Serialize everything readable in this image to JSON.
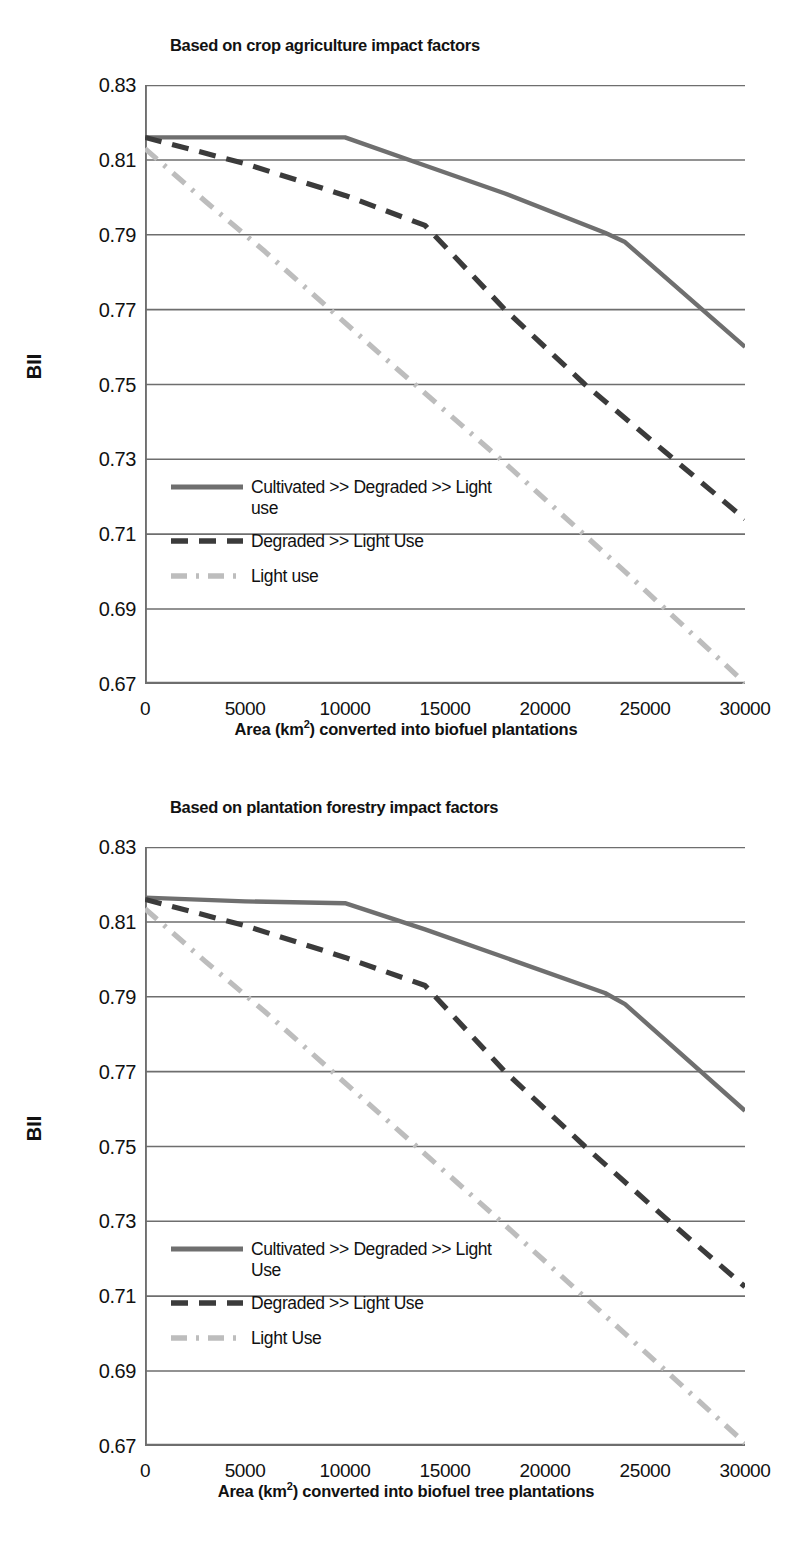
{
  "figure": {
    "panels": [
      {
        "id": "top",
        "title": "Based on crop agriculture impact factors",
        "ylabel": "BII",
        "xlabel_html": "Area (km<sup>2</sup>) converted into biofuel plantations",
        "xlabel": "Area (km2) converted into biofuel plantations",
        "legend": [
          "Cultivated >> Degraded >> Light use",
          "Degraded >> Light Use",
          "Light use"
        ]
      },
      {
        "id": "bottom",
        "title": "Based on plantation forestry impact factors",
        "ylabel": "BII",
        "xlabel_html": "Area (km<sup>2</sup>) converted into biofuel tree plantations",
        "xlabel": "Area (km2) converted into biofuel tree plantations",
        "legend": [
          "Cultivated >> Degraded >> Light Use",
          "Degraded >> Light Use",
          "Light Use"
        ]
      }
    ],
    "colors": {
      "solid": "#6f6f6f",
      "dashed": "#3b3b3b",
      "dashdot": "#bdbdbd",
      "grid": "#6e6e6e",
      "axis": "#6e6e6e",
      "text": "#111111"
    }
  },
  "chart_data": [
    {
      "type": "line",
      "id": "top",
      "title": "Based on crop agriculture impact factors",
      "xlabel": "Area (km2) converted into biofuel plantations",
      "ylabel": "BII",
      "xlim": [
        0,
        30000
      ],
      "ylim": [
        0.67,
        0.83
      ],
      "xticks": [
        0,
        5000,
        10000,
        15000,
        20000,
        25000,
        30000
      ],
      "yticks": [
        0.67,
        0.69,
        0.71,
        0.73,
        0.75,
        0.77,
        0.79,
        0.81,
        0.83
      ],
      "grid": "horizontal",
      "legend_position": "inside-lower-left",
      "series": [
        {
          "name": "Cultivated >> Degraded >> Light use",
          "style": "solid",
          "color": "#6f6f6f",
          "x": [
            0,
            5000,
            10000,
            14000,
            18000,
            23000,
            24000,
            30000
          ],
          "y": [
            0.816,
            0.816,
            0.816,
            0.8085,
            0.801,
            0.7905,
            0.788,
            0.76
          ]
        },
        {
          "name": "Degraded >> Light Use",
          "style": "dashed",
          "color": "#3b3b3b",
          "x": [
            0,
            5000,
            10000,
            14000,
            18000,
            22000,
            26000,
            30000
          ],
          "y": [
            0.816,
            0.809,
            0.8005,
            0.7925,
            0.77,
            0.75,
            0.732,
            0.714
          ]
        },
        {
          "name": "Light use",
          "style": "dashdot",
          "color": "#bdbdbd",
          "x": [
            0,
            3000,
            6000,
            12000,
            18000,
            24000,
            30000
          ],
          "y": [
            0.813,
            0.799,
            0.7855,
            0.757,
            0.729,
            0.7,
            0.67
          ]
        }
      ]
    },
    {
      "type": "line",
      "id": "bottom",
      "title": "Based on plantation forestry impact factors",
      "xlabel": "Area (km2) converted into biofuel tree plantations",
      "ylabel": "BII",
      "xlim": [
        0,
        30000
      ],
      "ylim": [
        0.67,
        0.83
      ],
      "xticks": [
        0,
        5000,
        10000,
        15000,
        20000,
        25000,
        30000
      ],
      "yticks": [
        0.67,
        0.69,
        0.71,
        0.73,
        0.75,
        0.77,
        0.79,
        0.81,
        0.83
      ],
      "grid": "horizontal",
      "legend_position": "inside-lower-left",
      "series": [
        {
          "name": "Cultivated >> Degraded >> Light Use",
          "style": "solid",
          "color": "#6f6f6f",
          "x": [
            0,
            5000,
            10000,
            14000,
            18000,
            23000,
            24000,
            30000
          ],
          "y": [
            0.8165,
            0.8155,
            0.815,
            0.808,
            0.8005,
            0.791,
            0.788,
            0.7595
          ]
        },
        {
          "name": "Degraded >> Light Use",
          "style": "dashed",
          "color": "#3b3b3b",
          "x": [
            0,
            5000,
            10000,
            14000,
            18000,
            22000,
            26000,
            30000
          ],
          "y": [
            0.816,
            0.809,
            0.8005,
            0.793,
            0.77,
            0.75,
            0.731,
            0.7125
          ]
        },
        {
          "name": "Light Use",
          "style": "dashdot",
          "color": "#bdbdbd",
          "x": [
            0,
            3000,
            6000,
            12000,
            18000,
            24000,
            30000
          ],
          "y": [
            0.8135,
            0.7995,
            0.786,
            0.7575,
            0.729,
            0.7,
            0.6705
          ]
        }
      ]
    }
  ]
}
